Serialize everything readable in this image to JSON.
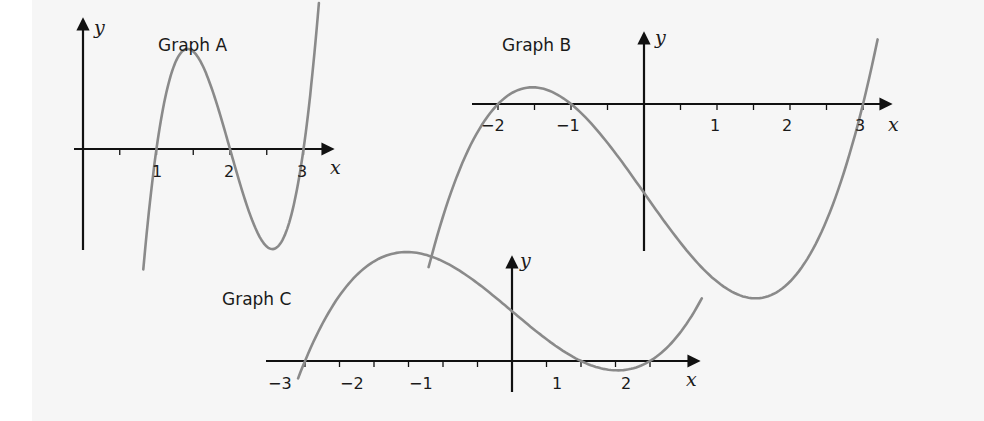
{
  "colors": {
    "background": "#ffffff",
    "panel": "#f6f6f6",
    "axis": "#111111",
    "curve": "#8a8a8a",
    "text": "#1a1a1a"
  },
  "chart_data": [
    {
      "id": "A",
      "type": "line",
      "title": "Graph A",
      "xlabel": "x",
      "ylabel": "y",
      "x_tick_labels": [
        "1",
        "2",
        "3"
      ],
      "x_ticks": [
        0.5,
        1,
        1.5,
        2,
        2.5,
        3
      ],
      "roots": [
        1,
        2,
        3
      ],
      "function": "y = k(x-1)(x-2)(x-3)",
      "xlim": [
        0,
        3.3
      ],
      "grid": false,
      "layout": {
        "origin_px": [
          83,
          149
        ],
        "unit_px": 73.5,
        "y_scale_px": 260,
        "x_range": [
          0.82,
          3.21
        ],
        "yaxis_top": 16,
        "yaxis_bottom": 250,
        "xaxis_left": 74,
        "xaxis_right": 336
      }
    },
    {
      "id": "B",
      "type": "line",
      "title": "Graph B",
      "xlabel": "x",
      "ylabel": "y",
      "x_tick_labels": [
        "-2",
        "-1",
        "1",
        "2",
        "3"
      ],
      "x_ticks": [
        -2,
        -1.5,
        -1,
        -0.5,
        0.5,
        1,
        1.5,
        2,
        2.5,
        3
      ],
      "roots": [
        -2,
        -1,
        3
      ],
      "function": "y = k(x+2)(x+1)(x-3)",
      "xlim": [
        -2.4,
        3.3
      ],
      "grid": false,
      "layout": {
        "origin_px": [
          644,
          104
        ],
        "unit_px": 73,
        "y_scale_px": 14.8,
        "x_range": [
          -2.95,
          3.2
        ],
        "yaxis_top": 14,
        "yaxis_bottom": 251,
        "xaxis_left": 472,
        "xaxis_right": 892
      }
    },
    {
      "id": "C",
      "type": "line",
      "title": "Graph C",
      "xlabel": "x",
      "ylabel": "y",
      "x_tick_labels": [
        "-3",
        "-2",
        "-1",
        "1",
        "2"
      ],
      "x_ticks": [
        -3,
        -2.5,
        -2,
        -1.5,
        -1,
        -0.5,
        0.5,
        1,
        1.5,
        2
      ],
      "roots": [
        -3,
        1,
        2
      ],
      "function": "y = k(x+3)(x-1)(x-2)",
      "xlim": [
        -3.2,
        2.5
      ],
      "grid": false,
      "layout": {
        "origin_px": [
          512,
          361
        ],
        "unit_px": 69,
        "y_scale_px": 8.3,
        "x_range": [
          -3.1,
          2.75
        ],
        "yaxis_top": 255,
        "yaxis_bottom": 392,
        "xaxis_left": 266,
        "xaxis_right": 700
      }
    }
  ]
}
